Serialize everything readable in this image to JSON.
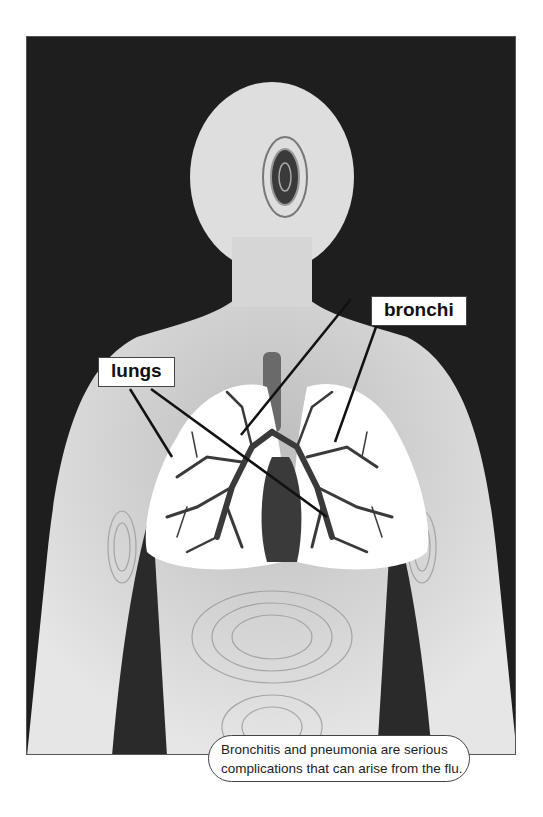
{
  "figure": {
    "labels": [
      {
        "id": "bronchi",
        "text": "bronchi"
      },
      {
        "id": "lungs",
        "text": "lungs"
      }
    ],
    "caption": {
      "line1": "Bronchitis and pneumonia are serious",
      "line2": "complications that can arise from the flu."
    },
    "colors": {
      "background": "#1e1e1e",
      "body": "#d8d8d8",
      "lungs": "#ffffff",
      "airways": "#3a3a3a"
    }
  }
}
